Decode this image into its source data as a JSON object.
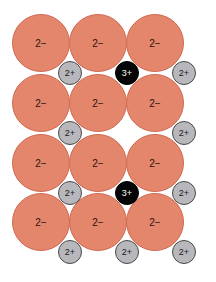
{
  "diagram": {
    "colors": {
      "anion": "#e3866c",
      "cation_2plus": "#b8b8bc",
      "cation_3plus": "#050505"
    },
    "anions": [
      {
        "label": "2−",
        "x": 41,
        "y": 43
      },
      {
        "label": "2−",
        "x": 98,
        "y": 43
      },
      {
        "label": "2−",
        "x": 155,
        "y": 43
      },
      {
        "label": "2−",
        "x": 41,
        "y": 103
      },
      {
        "label": "2−",
        "x": 98,
        "y": 103
      },
      {
        "label": "2−",
        "x": 155,
        "y": 103
      },
      {
        "label": "2−",
        "x": 41,
        "y": 163
      },
      {
        "label": "2−",
        "x": 98,
        "y": 163
      },
      {
        "label": "2−",
        "x": 155,
        "y": 163
      },
      {
        "label": "2−",
        "x": 41,
        "y": 222
      },
      {
        "label": "2−",
        "x": 98,
        "y": 222
      },
      {
        "label": "2−",
        "x": 155,
        "y": 222
      }
    ],
    "cations": [
      {
        "label": "2+",
        "type": "cation2",
        "x": 70,
        "y": 73
      },
      {
        "label": "3+",
        "type": "cation3",
        "x": 127,
        "y": 73
      },
      {
        "label": "2+",
        "type": "cation2",
        "x": 184,
        "y": 73
      },
      {
        "label": "2+",
        "type": "cation2",
        "x": 70,
        "y": 133
      },
      {
        "label": "2+",
        "type": "cation2",
        "x": 184,
        "y": 133
      },
      {
        "label": "2+",
        "type": "cation2",
        "x": 70,
        "y": 193
      },
      {
        "label": "3+",
        "type": "cation3",
        "x": 127,
        "y": 193
      },
      {
        "label": "2+",
        "type": "cation2",
        "x": 184,
        "y": 193
      },
      {
        "label": "2+",
        "type": "cation2",
        "x": 70,
        "y": 252
      },
      {
        "label": "2+",
        "type": "cation2",
        "x": 127,
        "y": 252
      },
      {
        "label": "2+",
        "type": "cation2",
        "x": 184,
        "y": 252
      }
    ],
    "vacancy": {
      "x": 127,
      "y": 133
    }
  }
}
